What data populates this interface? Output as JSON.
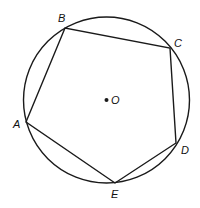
{
  "diagram": {
    "stroke_color": "#1a1a1a",
    "circle": {
      "center": {
        "x": 106.5,
        "y": 100
      },
      "radius": 83,
      "center_label": "O"
    },
    "vertices": [
      {
        "label": "A",
        "x": 26,
        "y": 122,
        "lx": 13,
        "ly": 128
      },
      {
        "label": "B",
        "x": 65,
        "y": 28,
        "lx": 58,
        "ly": 22
      },
      {
        "label": "C",
        "x": 170,
        "y": 48,
        "lx": 174,
        "ly": 47
      },
      {
        "label": "D",
        "x": 176,
        "y": 143,
        "lx": 181,
        "ly": 154
      },
      {
        "label": "E",
        "x": 115,
        "y": 183,
        "lx": 111,
        "ly": 198
      }
    ],
    "center_point_label_pos": {
      "x": 111,
      "y": 104
    }
  }
}
